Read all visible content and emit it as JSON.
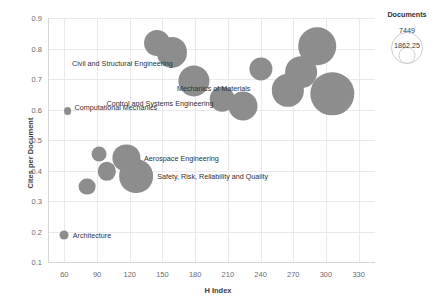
{
  "chart_data": {
    "type": "scatter",
    "title": "",
    "xlabel": "H Index",
    "ylabel": "Cites per Document",
    "xlim": [
      45,
      345
    ],
    "ylim": [
      0.1,
      0.9
    ],
    "xticks": [
      60,
      90,
      120,
      150,
      180,
      210,
      240,
      270,
      300,
      330
    ],
    "yticks": [
      "0.9",
      "0.8",
      "0.7",
      "0.6",
      "0.5",
      "0.4",
      "0.3",
      "0.2",
      "0.1"
    ],
    "grid": true,
    "size_key": "Documents",
    "legend": {
      "title": "Documents",
      "position": "top-right",
      "entries": [
        {
          "value": "7449",
          "size": 7449
        },
        {
          "value": "1862.25",
          "size": 1862.25
        }
      ]
    },
    "bubble_color": "#8d8d8d",
    "points": [
      {
        "label": "Architecture",
        "x": 60,
        "y": 0.19,
        "size": 120,
        "label_pos": "right"
      },
      {
        "label": "",
        "x": 81,
        "y": 0.347,
        "size": 420,
        "label_pos": "none"
      },
      {
        "label": "",
        "x": 92,
        "y": 0.455,
        "size": 330,
        "label_pos": "none"
      },
      {
        "label": "",
        "x": 99,
        "y": 0.397,
        "size": 500,
        "label_pos": "none"
      },
      {
        "label": "Aerospace Engineering",
        "x": 117,
        "y": 0.44,
        "size": 1100,
        "label_pos": "right"
      },
      {
        "label": "Safety, Risk, Reliability and Quality",
        "x": 126,
        "y": 0.381,
        "size": 1700,
        "label_pos": "right"
      },
      {
        "label": "Computational Mechanics",
        "x": 63,
        "y": 0.595,
        "size": 90,
        "label_pos": "above-right"
      },
      {
        "label": "Civil and Structural Engineering",
        "x": 145,
        "y": 0.818,
        "size": 1000,
        "label_pos": "below-right"
      },
      {
        "label": "",
        "x": 159,
        "y": 0.787,
        "size": 1350,
        "label_pos": "none"
      },
      {
        "label": "Control and Systems Engineering",
        "x": 179,
        "y": 0.695,
        "size": 1450,
        "label_pos": "below-right"
      },
      {
        "label": "",
        "x": 205,
        "y": 0.633,
        "size": 900,
        "label_pos": "none"
      },
      {
        "label": "",
        "x": 224,
        "y": 0.612,
        "size": 1250,
        "label_pos": "none"
      },
      {
        "label": "Mechanics of Materials",
        "x": 240,
        "y": 0.733,
        "size": 800,
        "label_pos": "below-left"
      },
      {
        "label": "",
        "x": 265,
        "y": 0.663,
        "size": 1550,
        "label_pos": "none"
      },
      {
        "label": "",
        "x": 277,
        "y": 0.723,
        "size": 1500,
        "label_pos": "none"
      },
      {
        "label": "",
        "x": 292,
        "y": 0.808,
        "size": 2100,
        "label_pos": "none"
      },
      {
        "label": "",
        "x": 306,
        "y": 0.652,
        "size": 2800,
        "label_pos": "none"
      }
    ]
  }
}
